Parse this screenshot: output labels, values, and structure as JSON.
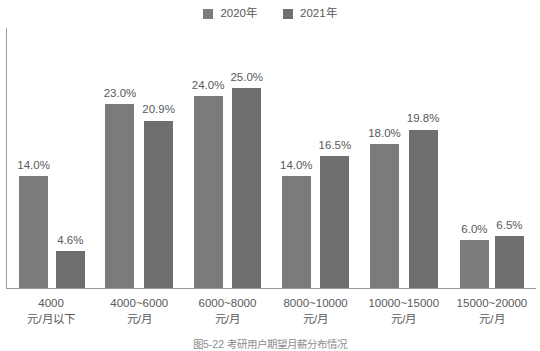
{
  "legend": {
    "position": "top-center",
    "entries": [
      {
        "label": "2020年",
        "color": "#7b7b7b",
        "swatch_icon": "square-marker"
      },
      {
        "label": "2021年",
        "color": "#6f6f6f",
        "swatch_icon": "square-marker"
      }
    ]
  },
  "caption": {
    "text": "图5-22 考研用户期望月薪分布情况"
  },
  "chart_data": {
    "type": "bar",
    "title": "",
    "subtitle": "",
    "xlabel": "",
    "ylabel": "",
    "ylim": [
      0,
      30
    ],
    "grid": false,
    "legend_position": "top-center",
    "categories": [
      "4000元/月以下",
      "4000~6000元/月",
      "6000~8000元/月",
      "8000~10000元/月",
      "10000~15000元/月",
      "15000~20000元/月"
    ],
    "category_lines": [
      [
        "4000",
        "元/月以下"
      ],
      [
        "4000~6000",
        "元/月"
      ],
      [
        "6000~8000",
        "元/月"
      ],
      [
        "8000~10000",
        "元/月"
      ],
      [
        "10000~15000",
        "元/月"
      ],
      [
        "15000~20000",
        "元/月"
      ]
    ],
    "series": [
      {
        "name": "2020年",
        "color": "#7b7b7b",
        "values": [
          14.0,
          23.0,
          24.0,
          14.0,
          18.0,
          6.0
        ],
        "labels": [
          "14.0%",
          "23.0%",
          "24.0%",
          "14.0%",
          "18.0%",
          "6.0%"
        ]
      },
      {
        "name": "2021年",
        "color": "#6f6f6f",
        "values": [
          4.6,
          20.9,
          25.0,
          16.5,
          19.8,
          6.5
        ],
        "labels": [
          "4.6%",
          "20.9%",
          "25.0%",
          "16.5%",
          "19.8%",
          "6.5%"
        ]
      }
    ]
  }
}
